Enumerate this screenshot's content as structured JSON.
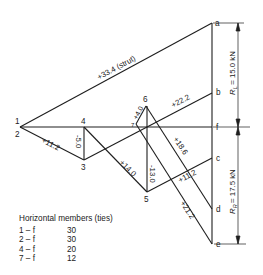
{
  "diagram": {
    "colors": {
      "line": "#1e1e1e",
      "text": "#222222",
      "background": "#ffffff"
    },
    "nodes": [
      {
        "id": "1",
        "x": 20,
        "y": 127
      },
      {
        "id": "2",
        "x": 20,
        "y": 127
      },
      {
        "id": "3",
        "x": 84,
        "y": 160
      },
      {
        "id": "4",
        "x": 84,
        "y": 127
      },
      {
        "id": "5",
        "x": 147,
        "y": 192
      },
      {
        "id": "6",
        "x": 146,
        "y": 106
      },
      {
        "id": "7",
        "x": 136,
        "y": 124
      },
      {
        "id": "a",
        "x": 212,
        "y": 23
      },
      {
        "id": "b",
        "x": 212,
        "y": 93
      },
      {
        "id": "f",
        "x": 212,
        "y": 127
      },
      {
        "id": "c",
        "x": 212,
        "y": 158
      },
      {
        "id": "d",
        "x": 212,
        "y": 209
      },
      {
        "id": "e",
        "x": 212,
        "y": 244
      }
    ],
    "member_labels": {
      "m1a": "+33.4 (strut)",
      "m6b": "+22.2",
      "m7_6": "+4.0",
      "m23": "+11.2",
      "m34": "-5.0",
      "m35": "+14.0",
      "m56": "-13.0",
      "m6d": "+18.6",
      "m5c": "+11.2",
      "m7e": "+21.2"
    },
    "reactions": {
      "left": {
        "symbol": "R",
        "subscript": "L",
        "value": "= 15.0 kN"
      },
      "right": {
        "symbol": "R",
        "subscript": "R",
        "value": "= 17.5 kN"
      }
    }
  },
  "legend": {
    "title": "Horizontal members (ties)",
    "rows": [
      {
        "member": "1 – f",
        "force": "30"
      },
      {
        "member": "2 – f",
        "force": "30"
      },
      {
        "member": "4 – f",
        "force": "20"
      },
      {
        "member": "7 – f",
        "force": "12"
      }
    ]
  }
}
